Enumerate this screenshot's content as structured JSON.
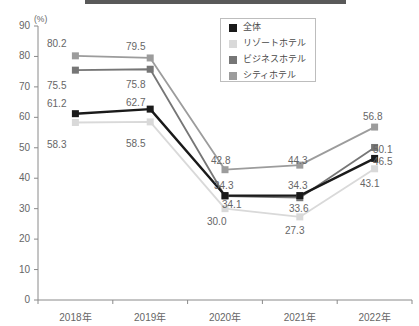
{
  "chart_data": {
    "type": "line",
    "title": "",
    "xlabel": "",
    "ylabel": "(%)",
    "ylim": [
      0,
      90
    ],
    "yticks": [
      "0",
      "10",
      "20",
      "30",
      "40",
      "50",
      "60",
      "70",
      "80",
      "90"
    ],
    "grid": false,
    "legend_position": "top-right",
    "categories": [
      "2018年",
      "2019年",
      "2020年",
      "2021年",
      "2022年"
    ],
    "series": [
      {
        "name": "全体",
        "color": "#1a1a1a",
        "values": [
          61.2,
          62.7,
          34.3,
          34.3,
          46.5
        ]
      },
      {
        "name": "リゾートホテル",
        "color": "#d9d9d9",
        "values": [
          58.3,
          58.5,
          30.0,
          27.3,
          43.1
        ]
      },
      {
        "name": "ビジネスホテル",
        "color": "#767676",
        "values": [
          75.5,
          75.8,
          34.1,
          33.6,
          50.1
        ]
      },
      {
        "name": "シティホテル",
        "color": "#9c9c9c",
        "values": [
          80.2,
          79.5,
          42.8,
          44.3,
          56.8
        ]
      }
    ],
    "data_labels": [
      {
        "text": "80.2",
        "x": 47,
        "y": 38
      },
      {
        "text": "75.5",
        "x": 47,
        "y": 80
      },
      {
        "text": "61.2",
        "x": 47,
        "y": 98
      },
      {
        "text": "58.3",
        "x": 47,
        "y": 139
      },
      {
        "text": "79.5",
        "x": 126,
        "y": 41
      },
      {
        "text": "75.8",
        "x": 126,
        "y": 79
      },
      {
        "text": "62.7",
        "x": 126,
        "y": 97
      },
      {
        "text": "58.5",
        "x": 126,
        "y": 138
      },
      {
        "text": "42.8",
        "x": 211,
        "y": 155
      },
      {
        "text": "34.3",
        "x": 214,
        "y": 180
      },
      {
        "text": "34.1",
        "x": 222,
        "y": 199
      },
      {
        "text": "30.0",
        "x": 207,
        "y": 216
      },
      {
        "text": "44.3",
        "x": 288,
        "y": 155
      },
      {
        "text": "34.3",
        "x": 288,
        "y": 180
      },
      {
        "text": "33.6",
        "x": 289,
        "y": 203
      },
      {
        "text": "27.3",
        "x": 285,
        "y": 225
      },
      {
        "text": "56.8",
        "x": 363,
        "y": 111
      },
      {
        "text": "50.1",
        "x": 373,
        "y": 144
      },
      {
        "text": "46.5",
        "x": 373,
        "y": 156
      },
      {
        "text": "43.1",
        "x": 360,
        "y": 178
      }
    ]
  },
  "legend": {
    "items": [
      {
        "label": "全体",
        "color": "#1a1a1a"
      },
      {
        "label": "リゾートホテル",
        "color": "#d9d9d9"
      },
      {
        "label": "ビジネスホテル",
        "color": "#767676"
      },
      {
        "label": "シティホテル",
        "color": "#9c9c9c"
      }
    ]
  }
}
